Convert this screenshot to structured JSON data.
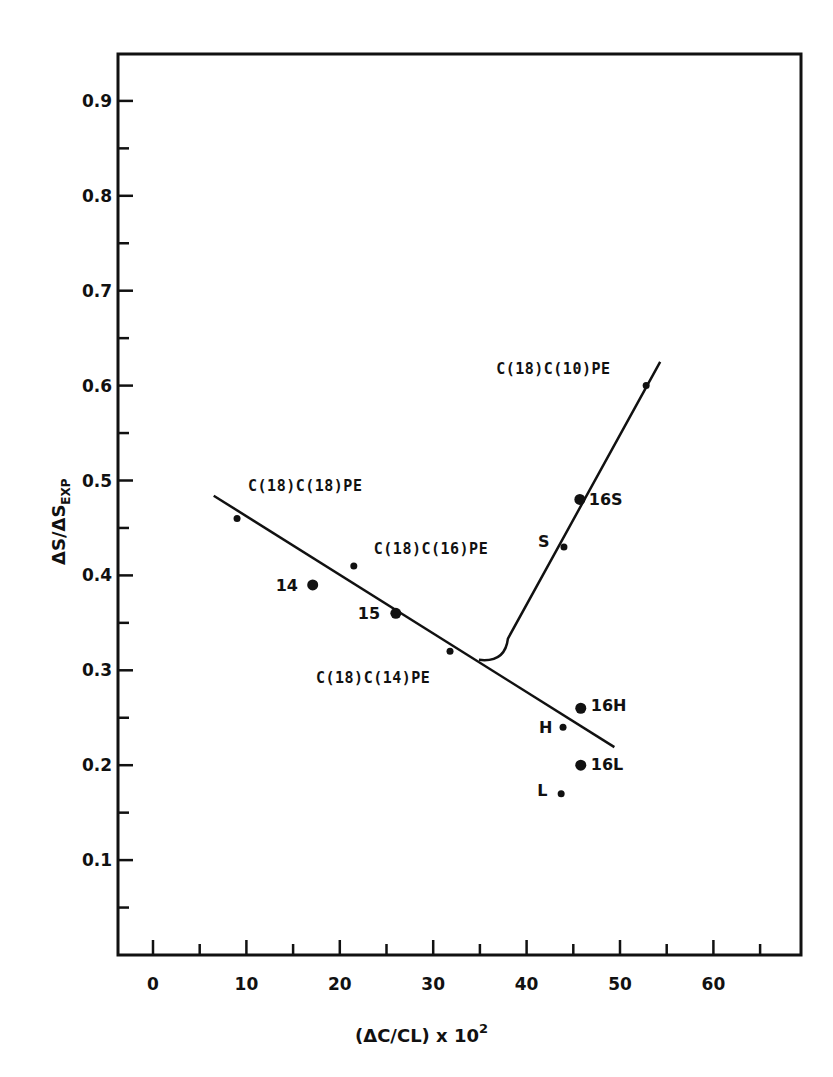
{
  "chart_data": {
    "type": "scatter",
    "title": "",
    "xlabel": "(ΔC/CL) x 10²",
    "xlabel_main": "(ΔC/CL) x 10",
    "xlabel_sup": "2",
    "ylabel": "ΔS/ΔS_EXP",
    "ylabel_main": "ΔS/ΔS",
    "ylabel_sub": "EXP",
    "xlim": [
      -3.7,
      69.5
    ],
    "ylim": [
      0.0,
      0.95
    ],
    "grid": false,
    "legend": "none",
    "x_ticks": [
      0,
      10,
      20,
      30,
      40,
      50,
      60
    ],
    "x_tick_labels": [
      "0",
      "10",
      "20",
      "30",
      "40",
      "50",
      "60"
    ],
    "x_minor_ticks": [
      5,
      15,
      25,
      35,
      45,
      55,
      65
    ],
    "y_ticks": [
      0.1,
      0.2,
      0.3,
      0.4,
      0.5,
      0.6,
      0.7,
      0.8,
      0.9
    ],
    "y_tick_labels": [
      "0.1",
      "0.2",
      "0.3",
      "0.4",
      "0.5",
      "0.6",
      "0.7",
      "0.8",
      "0.9"
    ],
    "y_minor_ticks": [
      0.05,
      0.15,
      0.25,
      0.35,
      0.45,
      0.55,
      0.65,
      0.75,
      0.85
    ],
    "points": [
      {
        "name": "C(18)C(18)PE",
        "x": 9.0,
        "y": 0.46,
        "marker": "small",
        "label": "C(18)C(18)PE",
        "label_dx": 11,
        "label_dy": -27,
        "anchor": "start"
      },
      {
        "name": "14",
        "x": 17.1,
        "y": 0.39,
        "marker": "large",
        "label": "14",
        "label_dx": -37,
        "label_dy": 6,
        "anchor": "start"
      },
      {
        "name": "C(18)C(16)PE",
        "x": 21.5,
        "y": 0.41,
        "marker": "small",
        "label": "C(18)C(16)PE",
        "label_dx": 20,
        "label_dy": -12,
        "anchor": "start"
      },
      {
        "name": "15",
        "x": 26.0,
        "y": 0.36,
        "marker": "large",
        "label": "15",
        "label_dx": -38,
        "label_dy": 6,
        "anchor": "start"
      },
      {
        "name": "C(18)C(14)PE",
        "x": 31.8,
        "y": 0.32,
        "marker": "small",
        "label": "C(18)C(14)PE",
        "label_dx": -134,
        "label_dy": 32,
        "anchor": "start"
      },
      {
        "name": "S",
        "x": 44.0,
        "y": 0.43,
        "marker": "small",
        "label": "S",
        "label_dx": -26,
        "label_dy": 0,
        "anchor": "start"
      },
      {
        "name": "16S",
        "x": 45.7,
        "y": 0.48,
        "marker": "large",
        "label": "16S",
        "label_dx": 9,
        "label_dy": 6,
        "anchor": "start"
      },
      {
        "name": "C(18)C(10)PE",
        "x": 52.8,
        "y": 0.6,
        "marker": "small",
        "label": "C(18)C(10)PE",
        "label_dx": -150,
        "label_dy": -12,
        "anchor": "start"
      },
      {
        "name": "16H",
        "x": 45.8,
        "y": 0.26,
        "marker": "large",
        "label": "16H",
        "label_dx": 10,
        "label_dy": 3,
        "anchor": "start"
      },
      {
        "name": "H",
        "x": 43.9,
        "y": 0.24,
        "marker": "small",
        "label": "H",
        "label_dx": -24,
        "label_dy": 6,
        "anchor": "start"
      },
      {
        "name": "16L",
        "x": 45.8,
        "y": 0.2,
        "marker": "large",
        "label": "16L",
        "label_dx": 10,
        "label_dy": 5,
        "anchor": "start"
      },
      {
        "name": "L",
        "x": 43.7,
        "y": 0.17,
        "marker": "small",
        "label": "L",
        "label_dx": -24,
        "label_dy": 2,
        "anchor": "start"
      }
    ],
    "lines": [
      {
        "name": "decreasing-fit-line",
        "points": [
          [
            6.5,
            0.484
          ],
          [
            49.4,
            0.219
          ]
        ]
      },
      {
        "name": "increasing-fit-curve",
        "points": [
          [
            34.9,
            0.311
          ],
          [
            36.2,
            0.31
          ],
          [
            38.0,
            0.325
          ],
          [
            54.3,
            0.625
          ]
        ]
      }
    ]
  }
}
